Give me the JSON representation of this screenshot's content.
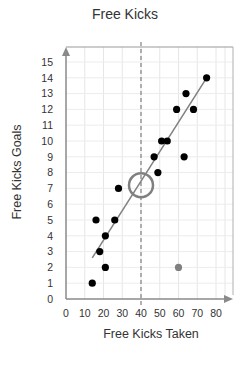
{
  "chart_data": {
    "type": "scatter",
    "title": "Free Kicks",
    "xlabel": "Free Kicks Taken",
    "ylabel": "Free Kicks Goals",
    "xlim": [
      0,
      80
    ],
    "ylim": [
      0,
      15
    ],
    "x_ticks": [
      0,
      10,
      20,
      30,
      40,
      50,
      60,
      70,
      80
    ],
    "y_ticks": [
      0,
      1,
      2,
      3,
      4,
      5,
      6,
      7,
      8,
      9,
      10,
      11,
      12,
      13,
      14,
      15
    ],
    "grid": true,
    "series": [
      {
        "name": "players",
        "color": "#000000",
        "points": [
          {
            "x": 14,
            "y": 1
          },
          {
            "x": 21,
            "y": 2
          },
          {
            "x": 18,
            "y": 3
          },
          {
            "x": 21,
            "y": 4
          },
          {
            "x": 16,
            "y": 5
          },
          {
            "x": 26,
            "y": 5
          },
          {
            "x": 28,
            "y": 7
          },
          {
            "x": 49,
            "y": 8
          },
          {
            "x": 47,
            "y": 9
          },
          {
            "x": 63,
            "y": 9
          },
          {
            "x": 51,
            "y": 10
          },
          {
            "x": 54,
            "y": 10
          },
          {
            "x": 59,
            "y": 12
          },
          {
            "x": 68,
            "y": 12
          },
          {
            "x": 64,
            "y": 13
          },
          {
            "x": 75,
            "y": 14
          }
        ]
      },
      {
        "name": "outlier",
        "color": "#808080",
        "points": [
          {
            "x": 60,
            "y": 2
          }
        ]
      }
    ],
    "trend_line": {
      "x1": 14,
      "y1": 2.6,
      "x2": 75,
      "y2": 14,
      "color": "#808080"
    },
    "annotations": [
      {
        "type": "vertical-dashed-line",
        "x": 40,
        "color": "#808080"
      },
      {
        "type": "open-circle",
        "x": 40,
        "y": 7.2,
        "radius_px": 12,
        "color": "#808080"
      }
    ]
  }
}
